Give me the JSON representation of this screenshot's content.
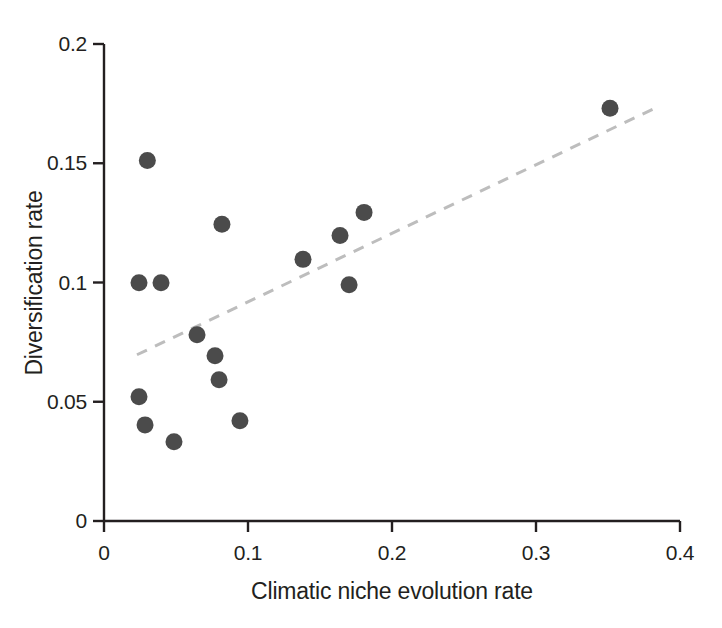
{
  "chart_data": {
    "type": "scatter",
    "title": "",
    "xlabel": "Climatic niche evolution rate",
    "ylabel": "Diversification rate",
    "xlim": [
      0,
      0.4
    ],
    "ylim": [
      0,
      0.2
    ],
    "xticks": [
      "0",
      "0.1",
      "0.2",
      "0.3",
      "0.4"
    ],
    "xtick_values": [
      0,
      0.1,
      0.2,
      0.3,
      0.4
    ],
    "yticks": [
      "0",
      "0.05",
      "0.1",
      "0.15",
      "0.2"
    ],
    "ytick_values": [
      0,
      0.05,
      0.1,
      0.15,
      0.2
    ],
    "grid": false,
    "legend": null,
    "marker": {
      "shape": "circle",
      "color": "#4b4b4b",
      "size": 17
    },
    "points": [
      {
        "x": 0.0301,
        "y": 0.1512
      },
      {
        "x": 0.0243,
        "y": 0.0999
      },
      {
        "x": 0.0396,
        "y": 0.0999
      },
      {
        "x": 0.0243,
        "y": 0.0521
      },
      {
        "x": 0.0285,
        "y": 0.0403
      },
      {
        "x": 0.0486,
        "y": 0.0332
      },
      {
        "x": 0.0646,
        "y": 0.0781
      },
      {
        "x": 0.0819,
        "y": 0.1244
      },
      {
        "x": 0.0771,
        "y": 0.0693
      },
      {
        "x": 0.0799,
        "y": 0.0592
      },
      {
        "x": 0.0944,
        "y": 0.042
      },
      {
        "x": 0.1382,
        "y": 0.1097
      },
      {
        "x": 0.1639,
        "y": 0.1197
      },
      {
        "x": 0.1806,
        "y": 0.1294
      },
      {
        "x": 0.1702,
        "y": 0.0991
      },
      {
        "x": 0.3514,
        "y": 0.1731
      }
    ],
    "trend_line": {
      "style": "dashed",
      "color": "#bdbdbd",
      "x_start": 0.0229,
      "y_start": 0.0697,
      "x_end": 0.3826,
      "y_end": 0.1731
    }
  }
}
